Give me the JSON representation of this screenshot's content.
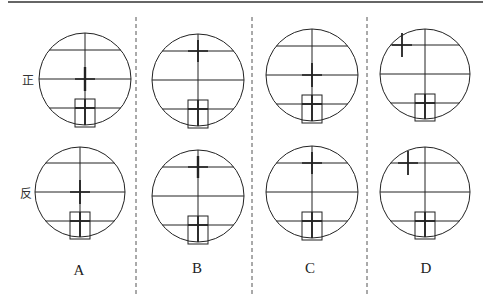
{
  "row_labels": [
    {
      "id": "face-left",
      "text": "正",
      "x": 28,
      "y": 79
    },
    {
      "id": "face-right",
      "text": "反",
      "x": 26,
      "y": 192
    }
  ],
  "options": [
    {
      "label": "A",
      "label_x": 79,
      "label_y": 270,
      "top": {
        "cx": 85,
        "cy": 79,
        "r": 46,
        "cross_dx": 0,
        "cross_dy": 0,
        "cross_bold_vertical": true
      },
      "bottom": {
        "cx": 80,
        "cy": 192,
        "r": 45,
        "cross_dx": 0,
        "cross_dy": 0,
        "cross_bold_vertical": false
      }
    },
    {
      "label": "B",
      "label_x": 197,
      "label_y": 268,
      "top": {
        "cx": 198,
        "cy": 80,
        "r": 46,
        "cross_dx": 0,
        "cross_dy": -29,
        "cross_bold_vertical": false
      },
      "bottom": {
        "cx": 198,
        "cy": 196,
        "r": 46,
        "cross_dx": 0,
        "cross_dy": -29,
        "cross_bold_vertical": true
      }
    },
    {
      "label": "C",
      "label_x": 310,
      "label_y": 268,
      "top": {
        "cx": 312,
        "cy": 75,
        "r": 46,
        "cross_dx": 0,
        "cross_dy": 0,
        "cross_bold_vertical": false
      },
      "bottom": {
        "cx": 312,
        "cy": 192,
        "r": 46,
        "cross_dx": 0,
        "cross_dy": -29,
        "cross_bold_vertical": false
      }
    },
    {
      "label": "D",
      "label_x": 426,
      "label_y": 268,
      "top": {
        "cx": 425,
        "cy": 74,
        "r": 45,
        "cross_dx": -23,
        "cross_dy": -29,
        "cross_bold_vertical": false
      },
      "bottom": {
        "cx": 425,
        "cy": 192,
        "r": 45,
        "cross_dx": -17,
        "cross_dy": -29,
        "cross_bold_vertical": false
      }
    }
  ],
  "dividers_x": [
    136,
    252,
    367
  ],
  "colors": {
    "line": "#222222",
    "divider": "#555555"
  }
}
